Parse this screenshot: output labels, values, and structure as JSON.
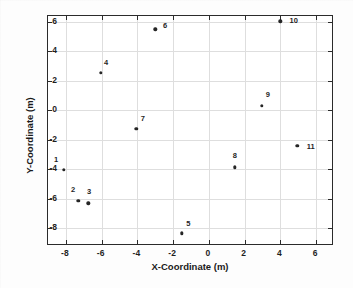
{
  "chart_data": {
    "type": "scatter",
    "title": "",
    "xlabel": "X-Coordinate (m)",
    "ylabel": "Y-Coordinate (m)",
    "xlim": [
      -9.0,
      7.0
    ],
    "ylim": [
      -9.2,
      6.4
    ],
    "xticks": [
      -8,
      -6,
      -4,
      -2,
      0,
      2,
      4,
      6
    ],
    "yticks": [
      -8,
      -6,
      -4,
      -2,
      0,
      2,
      4,
      6
    ],
    "xticklabels": [
      "-8",
      "-6",
      "-4",
      "-2",
      "0",
      "2",
      "4",
      "6"
    ],
    "yticklabels": [
      "-8",
      "-6",
      "-4",
      "-2",
      "0",
      "2",
      "4",
      "6"
    ],
    "grid": true,
    "legend": "none",
    "marker_color": "#262626",
    "grid_color": "#dedede",
    "frame_color": "#2b2b2b",
    "points": [
      {
        "label": "1",
        "x": -8.1,
        "y": -4.05,
        "label_dx": -0.45,
        "label_dy": 0.75
      },
      {
        "label": "2",
        "x": -7.3,
        "y": -6.15,
        "label_dx": -0.3,
        "label_dy": 0.8
      },
      {
        "label": "3",
        "x": -6.75,
        "y": -6.3,
        "label_dx": 0.05,
        "label_dy": 0.85
      },
      {
        "label": "4",
        "x": -6.05,
        "y": 2.55,
        "label_dx": 0.3,
        "label_dy": 0.75
      },
      {
        "label": "5",
        "x": -1.5,
        "y": -8.35,
        "label_dx": 0.35,
        "label_dy": 0.7
      },
      {
        "label": "6",
        "x": -3.0,
        "y": 5.5,
        "label_dx": 0.55,
        "label_dy": 0.3
      },
      {
        "label": "7",
        "x": -4.05,
        "y": -1.25,
        "label_dx": 0.35,
        "label_dy": 0.75
      },
      {
        "label": "8",
        "x": 1.45,
        "y": -3.85,
        "label_dx": 0.0,
        "label_dy": 0.85
      },
      {
        "label": "9",
        "x": 2.95,
        "y": 0.3,
        "label_dx": 0.35,
        "label_dy": 0.8
      },
      {
        "label": "10",
        "x": 4.0,
        "y": 6.05,
        "label_dx": 0.75,
        "label_dy": 0.05
      },
      {
        "label": "11",
        "x": 4.95,
        "y": -2.4,
        "label_dx": 0.75,
        "label_dy": 0.0
      }
    ]
  }
}
